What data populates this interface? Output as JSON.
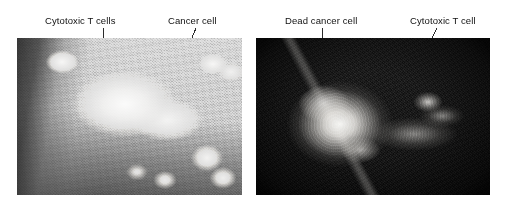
{
  "figure": {
    "background_color": "#ffffff",
    "label_color": "#101010",
    "leader_color": "#2b2b2b",
    "panels": [
      {
        "id": "left",
        "name": "cytotoxic-t-cells-attacking-cancer-cell",
        "type": "scanning-electron-micrograph",
        "tone": "light-grey-granular",
        "labels": [
          {
            "id": "cytotoxic-t-cells",
            "text": "Cytotoxic T cells"
          },
          {
            "id": "cancer-cell",
            "text": "Cancer cell"
          }
        ]
      },
      {
        "id": "right",
        "name": "dead-cancer-cell-with-t-cell",
        "type": "scanning-electron-micrograph",
        "tone": "dark-high-contrast",
        "labels": [
          {
            "id": "dead-cancer-cell",
            "text": "Dead cancer cell"
          },
          {
            "id": "cytotoxic-t-cell",
            "text": "Cytotoxic T cell"
          }
        ]
      }
    ]
  }
}
